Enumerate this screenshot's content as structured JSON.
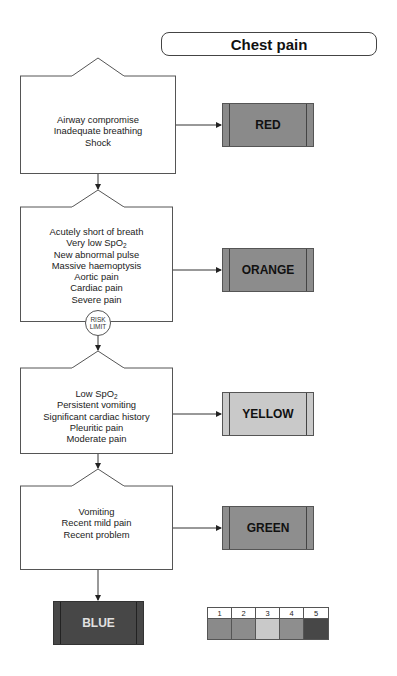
{
  "title": "Chest pain",
  "colors": {
    "red": "#8a8a8a",
    "orange": "#8c8c8c",
    "yellow": "#c9c9c9",
    "green": "#8e8e8e",
    "blue": "#474747",
    "blue_text": "#e0e0e0",
    "line": "#555555"
  },
  "steps": [
    {
      "criteria": [
        "Airway compromise",
        "Inadequate breathing",
        "Shock"
      ],
      "priority": "RED"
    },
    {
      "criteria": [
        "Acutely short of breath",
        "Very low SpO2",
        "New abnormal pulse",
        "Massive haemoptysis",
        "Aortic pain",
        "Cardiac pain",
        "Severe pain"
      ],
      "priority": "ORANGE"
    },
    {
      "criteria": [
        "Low SpO2",
        "Persistent vomiting",
        "Significant cardiac history",
        "Pleuritic pain",
        "Moderate pain"
      ],
      "priority": "YELLOW"
    },
    {
      "criteria": [
        "Vomiting",
        "Recent mild pain",
        "Recent problem"
      ],
      "priority": "GREEN"
    }
  ],
  "final": {
    "priority": "BLUE"
  },
  "risk_limit": {
    "line1": "RISK",
    "line2": "LIMIT"
  },
  "legend": {
    "numbers": [
      "1",
      "2",
      "3",
      "4",
      "5"
    ],
    "swatches": [
      "#8a8a8a",
      "#8c8c8c",
      "#c9c9c9",
      "#8e8e8e",
      "#474747"
    ]
  },
  "text_parts": {
    "spo2_prefix": "SpO",
    "spo2_sub": "2",
    "very_low": "Very low ",
    "low": "Low "
  }
}
